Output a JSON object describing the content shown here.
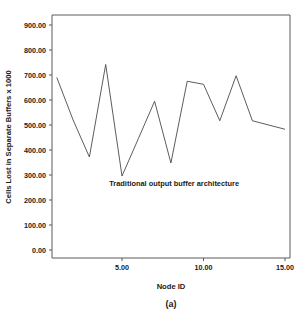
{
  "chart_data": {
    "type": "line",
    "title": "",
    "xlabel": "Node ID",
    "ylabel": "Cells Lost in Separate Buffers x 1000",
    "caption": "(a)",
    "xlim": [
      1,
      15
    ],
    "ylim": [
      0,
      900
    ],
    "grid": false,
    "legend": "none",
    "annotations": [
      {
        "text": "Traditional output buffer architecture",
        "x": 8.2,
        "y": 255
      }
    ],
    "xticks": [
      5,
      10,
      15
    ],
    "xtick_labels": [
      "5.00",
      "10.00",
      "15.00"
    ],
    "yticks": [
      0,
      100,
      200,
      300,
      400,
      500,
      600,
      700,
      800,
      900
    ],
    "ytick_labels": [
      "0.00",
      "100.00",
      "200.00",
      "300.00",
      "400.00",
      "500.00",
      "600.00",
      "700.00",
      "800.00",
      "900.00"
    ],
    "series": [
      {
        "name": "Traditional output buffer architecture",
        "x": [
          1,
          2,
          3,
          4,
          5,
          6,
          7,
          8,
          9,
          10,
          11,
          12,
          13,
          14,
          15
        ],
        "values": [
          690,
          520,
          372,
          742,
          296,
          445,
          595,
          348,
          675,
          663,
          517,
          697,
          517,
          500,
          483
        ],
        "color": "#4a4a4a"
      }
    ]
  },
  "colors": {
    "axis": "#5a5a5a",
    "text": "#1a1a1a",
    "line": "#4a4a4a",
    "background": "#ffffff"
  }
}
